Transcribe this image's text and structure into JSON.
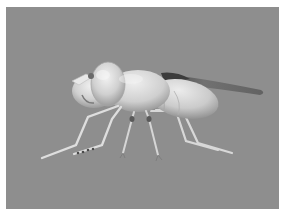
{
  "image": {
    "subject": "3D rendered fly model",
    "style": "grayscale",
    "colors": {
      "background": "#8e8e8e",
      "border": "#ffffff",
      "body_light": "#e4e4e4",
      "body_mid": "#c8c8c8",
      "body_shadow": "#9a9a9a",
      "wing": "#6a6a6a",
      "wing_dark": "#3a3a3a",
      "leg": "#dcdcdc"
    }
  }
}
